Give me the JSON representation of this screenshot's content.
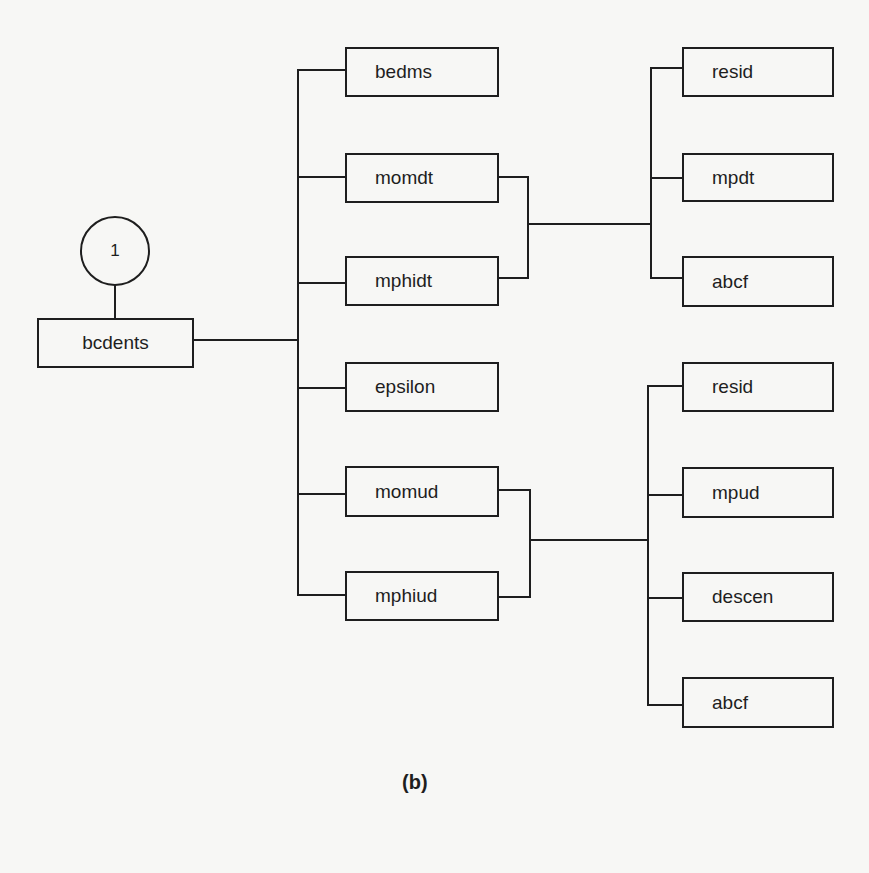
{
  "diagram": {
    "type": "call-tree",
    "caption": "(b)",
    "connector": {
      "id": "1",
      "label": "1"
    },
    "root": {
      "label": "bcdents"
    },
    "level1": [
      {
        "label": "bedms"
      },
      {
        "label": "momdt"
      },
      {
        "label": "mphidt"
      },
      {
        "label": "epsilon"
      },
      {
        "label": "momud"
      },
      {
        "label": "mphiud"
      }
    ],
    "group_dt": {
      "sources": [
        "momdt",
        "mphidt"
      ],
      "children": [
        {
          "label": "resid"
        },
        {
          "label": "mpdt"
        },
        {
          "label": "abcf"
        }
      ]
    },
    "group_ud": {
      "sources": [
        "momud",
        "mphiud"
      ],
      "children": [
        {
          "label": "resid"
        },
        {
          "label": "mpud"
        },
        {
          "label": "descen"
        },
        {
          "label": "abcf"
        }
      ]
    },
    "colors": {
      "line": "#1e1e1e",
      "background": "#f7f7f5"
    }
  }
}
